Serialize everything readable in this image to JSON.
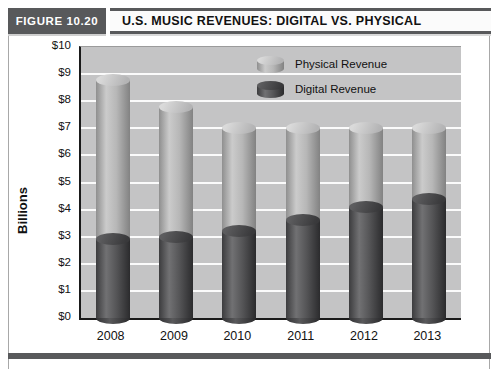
{
  "figure": {
    "label": "FIGURE 10.20",
    "title": "U.S. MUSIC REVENUES: DIGITAL VS. PHYSICAL"
  },
  "chart_data": {
    "type": "bar",
    "subtype": "stacked-cylinder-3d",
    "categories": [
      "2008",
      "2009",
      "2010",
      "2011",
      "2012",
      "2013"
    ],
    "series": [
      {
        "name": "Physical Revenue",
        "values": [
          5.9,
          4.8,
          3.8,
          3.4,
          2.9,
          2.6
        ],
        "color": "#b5b5b5",
        "stack": "top"
      },
      {
        "name": "Digital Revenue",
        "values": [
          2.9,
          3.0,
          3.2,
          3.6,
          4.1,
          4.4
        ],
        "color": "#4a4a4a",
        "stack": "bottom"
      }
    ],
    "totals": [
      8.8,
      7.8,
      7.0,
      7.0,
      7.0,
      7.0
    ],
    "title": "U.S. MUSIC REVENUES: DIGITAL VS. PHYSICAL",
    "xlabel": "",
    "ylabel": "Billions",
    "ylim": [
      0,
      10
    ],
    "ytick_step": 1,
    "ytick_prefix": "$",
    "ytick_labels": [
      "$0",
      "$1",
      "$2",
      "$3",
      "$4",
      "$5",
      "$6",
      "$7",
      "$8",
      "$9",
      "$10"
    ],
    "grid": true,
    "gridline_color": "#ffffff",
    "plot_background": "#c4c4c5",
    "legend_position": "top-center-inside",
    "legend": [
      "Physical Revenue",
      "Digital Revenue"
    ]
  },
  "colors": {
    "header_bar": "#58595b",
    "bottom_bar": "#58595b",
    "axis": "#1a1a1a",
    "physical_cylinder": "#b5b5b5",
    "digital_cylinder": "#4a4a4a"
  }
}
